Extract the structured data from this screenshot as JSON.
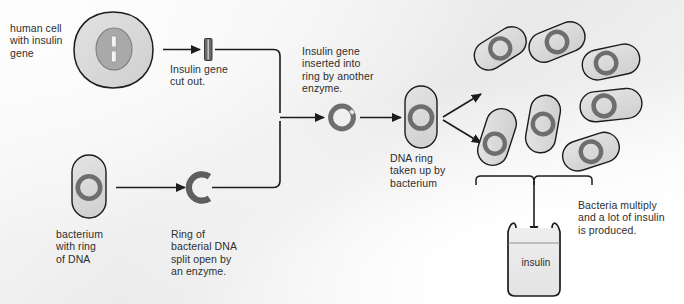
{
  "diagram": {
    "palette": {
      "background_light": "#fbfbfb",
      "background_mid": "#e9e9e9",
      "cell_fill": "#d8d8d8",
      "nucleus_fill": "#a8a8a8",
      "gene_fill": "#f2f2f2",
      "bacterium_fill": "#dcdcdc",
      "ring_stroke": "#6e6e6e",
      "outline": "#1c1c1c",
      "text": "#2e2e2e",
      "jar_fill": "#ebebeb"
    },
    "labels": {
      "human_cell": "human cell\nwith insulin\ngene",
      "gene_cut_out": "Insulin gene\ncut out.",
      "gene_inserted": "Insulin gene\ninserted into\nring by another\nenzyme.",
      "bacterium_ring": "bacterium\nwith ring\nof DNA",
      "ring_split": "Ring of\nbacterial DNA\nsplit open by\nan enzyme.",
      "ring_taken_up": "DNA ring\ntaken up by\nbacterium",
      "bacteria_multiply": "Bacteria multiply\nand a lot of insulin\nis produced.",
      "insulin_jar": "insulin"
    },
    "counts": {
      "bacteria_in_colony": 7
    },
    "icons": {
      "human_cell": "human-cell-icon",
      "nucleus": "nucleus-icon",
      "insulin_gene": "insulin-gene-icon",
      "bacterium": "bacterium-icon",
      "plasmid_ring": "plasmid-ring-icon",
      "split_ring": "split-ring-icon",
      "recombinant_ring": "recombinant-ring-icon",
      "insulin_jar": "insulin-jar-icon",
      "arrow": "arrow-icon",
      "brace": "brace-icon"
    }
  }
}
